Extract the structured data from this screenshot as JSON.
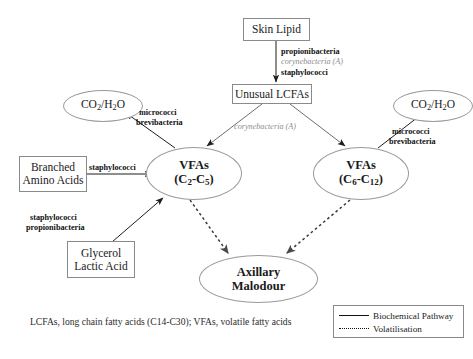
{
  "diagram": {
    "nodes": {
      "skin_lipid": "Skin Lipid",
      "unusual_lcfas": "Unusual LCFAs",
      "co2h2o_left_line1": "CO",
      "co2h2o_left_sub1": "2",
      "co2h2o_left_mid": "/H",
      "co2h2o_left_sub2": "2",
      "co2h2o_left_end": "O",
      "co2h2o_right_line1": "CO",
      "co2h2o_right_sub1": "2",
      "co2h2o_right_mid": "/H",
      "co2h2o_right_sub2": "2",
      "co2h2o_right_end": "O",
      "vfa_left_line1": "VFAs",
      "vfa_left_open": "(C",
      "vfa_left_sub1": "2",
      "vfa_left_dash": "-C",
      "vfa_left_sub2": "5",
      "vfa_left_close": ")",
      "vfa_right_line1": "VFAs",
      "vfa_right_open": "(C",
      "vfa_right_sub1": "6",
      "vfa_right_dash": "-C",
      "vfa_right_sub2": "12",
      "vfa_right_close": ")",
      "branched_line1": "Branched",
      "branched_line2": "Amino Acids",
      "glycerol_line1": "Glycerol",
      "glycerol_line2": "Lactic Acid",
      "malodour_line1": "Axillary",
      "malodour_line2": "Malodour"
    },
    "edge_labels": {
      "skin_to_lcfa_1": "propionibacteria",
      "skin_to_lcfa_2": "corynebacteria (A)",
      "skin_to_lcfa_3": "staphylococci",
      "lcfa_to_vfa_right": "corynebacteria (A)",
      "vfa_left_to_co2_1": "micrococci",
      "vfa_left_to_co2_2": "brevibacteria",
      "vfa_right_to_co2_1": "micrococci",
      "vfa_right_to_co2_2": "brevibacteria",
      "branched_to_vfa": "staphylococci",
      "glycerol_to_vfa_1": "staphylococci",
      "glycerol_to_vfa_2": "propionibacteria"
    },
    "caption": "LCFAs, long chain fatty acids (C14-C30); VFAs, volatile fatty acids",
    "legend": {
      "solid_label": "Biochemical Pathway",
      "dotted_label": "Volatilisation"
    },
    "colors": {
      "ink": "#111111",
      "muted_italic": "#8d8d8d",
      "node_border": "#8a8a8a",
      "background": "#ffffff"
    }
  }
}
